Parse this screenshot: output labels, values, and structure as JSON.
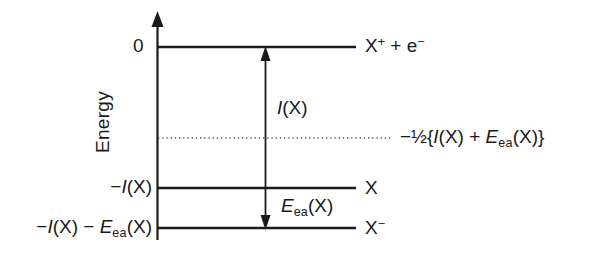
{
  "figure": {
    "type": "energy-level-diagram",
    "axis": {
      "label": "Energy",
      "direction": "up",
      "zero_tick": "0"
    },
    "levels": [
      {
        "id": "cation",
        "energy_label": "0",
        "species_label": "X",
        "species_charge": "+",
        "species_extra": " + e",
        "species_extra_charge": "−",
        "y": 47
      },
      {
        "id": "neutral",
        "energy_label": "−I(X)",
        "species_label": "X",
        "species_charge": "",
        "y": 188
      },
      {
        "id": "anion",
        "energy_label": "−I(X) − Eea(X)",
        "species_label": "X",
        "species_charge": "−",
        "y": 228
      }
    ],
    "reference_line": {
      "style": "dotted",
      "label": "−½{I(X) + Eea(X)}",
      "y": 138
    },
    "transitions": [
      {
        "id": "ionization",
        "label": "I(X)",
        "direction": "up",
        "from": "neutral",
        "to": "cation"
      },
      {
        "id": "electron-affinity",
        "label": "Eea(X)",
        "direction": "down",
        "from": "neutral",
        "to": "anion"
      }
    ],
    "text": {
      "zero": "0",
      "energy": "Energy",
      "cation_base": "X",
      "cation_sup": "+",
      "cation_mid": " + e",
      "cation_sup2": "−",
      "neutral_species": "X",
      "anion_species": "X",
      "anion_sup": "−",
      "minus": "−",
      "italic_i": "I",
      "paren_x": "(X)",
      "italic_e": "E",
      "sub_ea": "ea",
      "half": "½",
      "brace_open": "{",
      "brace_close": "}",
      "plus": "+",
      "space_dash_space": " − "
    },
    "colors": {
      "line": "#1a1a1a",
      "text": "#1a1a1a",
      "dotted": "#555555",
      "background": "#ffffff"
    }
  }
}
